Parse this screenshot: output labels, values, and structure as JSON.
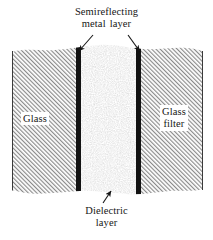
{
  "figure": {
    "type": "cross-section-diagram",
    "background_color": "#ffffff",
    "ink_color": "#161616"
  },
  "labels": {
    "top": {
      "line1": "Semireflecting",
      "line2_word1": "metal",
      "line2_word2": "layer"
    },
    "bottom": {
      "line1": "Dielectric",
      "line2": "layer"
    },
    "left_region": "Glass",
    "right_region": {
      "line1": "Glass",
      "line2": "filter"
    }
  },
  "layers": [
    {
      "name": "glass-substrate-left",
      "label": "Glass",
      "fill": "hatch-diagonal",
      "x_start": 12,
      "x_end": 76,
      "color": "#8f8f8f"
    },
    {
      "name": "semireflecting-metal-layer-left",
      "label": "Semireflecting metal layer",
      "fill": "solid-black",
      "x_start": 76,
      "x_end": 81,
      "color": "#121212"
    },
    {
      "name": "dielectric-layer",
      "label": "Dielectric layer",
      "fill": "stipple",
      "x_start": 81,
      "x_end": 136,
      "color": "#b8b8b8"
    },
    {
      "name": "semireflecting-metal-layer-right",
      "label": "Semireflecting metal layer",
      "fill": "solid-black",
      "x_start": 136,
      "x_end": 141,
      "color": "#121212"
    },
    {
      "name": "glass-filter-right",
      "label": "Glass filter",
      "fill": "hatch-diagonal",
      "x_start": 141,
      "x_end": 203,
      "color": "#8f8f8f"
    }
  ],
  "leader_lines": [
    {
      "name": "arrow-to-left-metal-layer",
      "from": [
        93,
        36
      ],
      "to": [
        78,
        52
      ],
      "points_at": "semireflecting-metal-layer-left"
    },
    {
      "name": "arrow-to-right-metal-layer",
      "from": [
        128,
        36
      ],
      "to": [
        140,
        52
      ],
      "points_at": "semireflecting-metal-layer-right"
    },
    {
      "name": "arrow-to-dielectric-layer",
      "from": [
        104,
        203
      ],
      "to": [
        111,
        192
      ],
      "points_at": "dielectric-layer"
    }
  ]
}
